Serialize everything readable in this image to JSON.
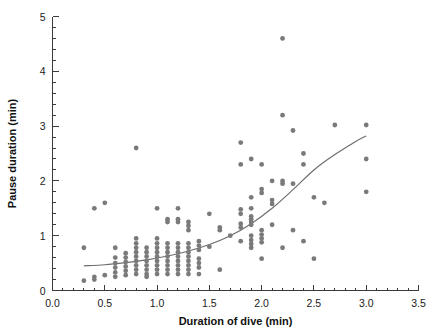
{
  "chart_data": {
    "type": "scatter",
    "title": "",
    "xlabel": "Duration of dive (min)",
    "ylabel": "Pause duration (min)",
    "xlim": [
      0.0,
      3.5
    ],
    "ylim": [
      0,
      5
    ],
    "xticks": [
      0.0,
      0.5,
      1.0,
      1.5,
      2.0,
      2.5,
      3.0,
      3.5
    ],
    "xticklabels": [
      "0.0",
      "0.5",
      "1.0",
      "1.5",
      "2.0",
      "2.5",
      "3.0",
      "3.5"
    ],
    "yticks": [
      0,
      1,
      2,
      3,
      4,
      5
    ],
    "yticklabels": [
      "0",
      "1",
      "2",
      "3",
      "4",
      "5"
    ],
    "x_minor_tick_step": 0.1,
    "y_minor_tick_step": 0.2,
    "grid": false,
    "legend": null,
    "marker": {
      "shape": "circle",
      "color": "#7a7a7a",
      "size_px": 4.6
    },
    "points": [
      [
        0.3,
        0.78
      ],
      [
        0.3,
        0.18
      ],
      [
        0.4,
        1.5
      ],
      [
        0.4,
        0.25
      ],
      [
        0.4,
        0.2
      ],
      [
        0.5,
        1.6
      ],
      [
        0.5,
        0.28
      ],
      [
        0.6,
        0.78
      ],
      [
        0.6,
        0.6
      ],
      [
        0.6,
        0.5
      ],
      [
        0.6,
        0.42
      ],
      [
        0.6,
        0.33
      ],
      [
        0.6,
        0.25
      ],
      [
        0.7,
        0.68
      ],
      [
        0.7,
        0.6
      ],
      [
        0.7,
        0.52
      ],
      [
        0.7,
        0.44
      ],
      [
        0.7,
        0.36
      ],
      [
        0.7,
        0.28
      ],
      [
        0.8,
        2.6
      ],
      [
        0.8,
        0.95
      ],
      [
        0.8,
        0.86
      ],
      [
        0.8,
        0.78
      ],
      [
        0.8,
        0.7
      ],
      [
        0.8,
        0.62
      ],
      [
        0.8,
        0.54
      ],
      [
        0.8,
        0.46
      ],
      [
        0.8,
        0.38
      ],
      [
        0.8,
        0.3
      ],
      [
        0.9,
        0.78
      ],
      [
        0.9,
        0.7
      ],
      [
        0.9,
        0.62
      ],
      [
        0.9,
        0.54
      ],
      [
        0.9,
        0.46
      ],
      [
        0.9,
        0.38
      ],
      [
        0.9,
        0.3
      ],
      [
        0.9,
        0.25
      ],
      [
        1.0,
        1.5
      ],
      [
        1.0,
        0.95
      ],
      [
        1.0,
        0.86
      ],
      [
        1.0,
        0.78
      ],
      [
        1.0,
        0.7
      ],
      [
        1.0,
        0.62
      ],
      [
        1.0,
        0.54
      ],
      [
        1.0,
        0.46
      ],
      [
        1.0,
        0.38
      ],
      [
        1.0,
        0.3
      ],
      [
        1.1,
        1.3
      ],
      [
        1.1,
        1.25
      ],
      [
        1.1,
        0.86
      ],
      [
        1.1,
        0.78
      ],
      [
        1.1,
        0.7
      ],
      [
        1.1,
        0.62
      ],
      [
        1.1,
        0.54
      ],
      [
        1.1,
        0.46
      ],
      [
        1.1,
        0.38
      ],
      [
        1.1,
        0.3
      ],
      [
        1.2,
        1.5
      ],
      [
        1.2,
        1.3
      ],
      [
        1.2,
        1.25
      ],
      [
        1.2,
        0.86
      ],
      [
        1.2,
        0.78
      ],
      [
        1.2,
        0.7
      ],
      [
        1.2,
        0.62
      ],
      [
        1.2,
        0.54
      ],
      [
        1.2,
        0.46
      ],
      [
        1.2,
        0.38
      ],
      [
        1.2,
        0.3
      ],
      [
        1.3,
        1.25
      ],
      [
        1.3,
        1.18
      ],
      [
        1.3,
        1.1
      ],
      [
        1.3,
        0.86
      ],
      [
        1.3,
        0.78
      ],
      [
        1.3,
        0.7
      ],
      [
        1.3,
        0.62
      ],
      [
        1.3,
        0.54
      ],
      [
        1.3,
        0.46
      ],
      [
        1.3,
        0.38
      ],
      [
        1.3,
        0.3
      ],
      [
        1.4,
        0.9
      ],
      [
        1.4,
        0.82
      ],
      [
        1.4,
        0.74
      ],
      [
        1.4,
        0.58
      ],
      [
        1.4,
        0.5
      ],
      [
        1.4,
        0.42
      ],
      [
        1.4,
        0.3
      ],
      [
        1.5,
        1.4
      ],
      [
        1.5,
        0.8
      ],
      [
        1.6,
        1.15
      ],
      [
        1.6,
        1.1
      ],
      [
        1.6,
        0.38
      ],
      [
        1.7,
        1.0
      ],
      [
        1.8,
        2.7
      ],
      [
        1.8,
        2.3
      ],
      [
        1.8,
        1.48
      ],
      [
        1.8,
        1.4
      ],
      [
        1.8,
        1.22
      ],
      [
        1.8,
        1.15
      ],
      [
        1.8,
        0.9
      ],
      [
        1.9,
        2.4
      ],
      [
        1.9,
        1.7
      ],
      [
        1.9,
        1.5
      ],
      [
        1.9,
        1.35
      ],
      [
        1.9,
        1.3
      ],
      [
        1.9,
        1.25
      ],
      [
        1.9,
        1.2
      ],
      [
        1.9,
        1.0
      ],
      [
        1.9,
        0.92
      ],
      [
        1.9,
        0.85
      ],
      [
        1.9,
        0.78
      ],
      [
        2.0,
        2.3
      ],
      [
        2.0,
        1.85
      ],
      [
        2.0,
        1.78
      ],
      [
        2.0,
        1.1
      ],
      [
        2.0,
        1.02
      ],
      [
        2.0,
        0.95
      ],
      [
        2.0,
        0.88
      ],
      [
        2.0,
        0.58
      ],
      [
        2.1,
        2.0
      ],
      [
        2.1,
        1.65
      ],
      [
        2.1,
        1.58
      ],
      [
        2.1,
        1.2
      ],
      [
        2.2,
        4.6
      ],
      [
        2.2,
        3.2
      ],
      [
        2.2,
        2.0
      ],
      [
        2.2,
        1.95
      ],
      [
        2.2,
        0.78
      ],
      [
        2.3,
        2.92
      ],
      [
        2.3,
        1.95
      ],
      [
        2.3,
        1.1
      ],
      [
        2.4,
        2.5
      ],
      [
        2.4,
        2.3
      ],
      [
        2.4,
        0.9
      ],
      [
        2.5,
        1.7
      ],
      [
        2.5,
        0.58
      ],
      [
        2.6,
        1.6
      ],
      [
        2.7,
        3.02
      ],
      [
        3.0,
        3.02
      ],
      [
        3.0,
        2.4
      ],
      [
        3.0,
        1.8
      ]
    ],
    "fit_curve": {
      "label": "fitted trend",
      "x": [
        0.3,
        0.5,
        0.7,
        0.9,
        1.1,
        1.3,
        1.5,
        1.7,
        1.9,
        2.1,
        2.3,
        2.5,
        2.7,
        2.9,
        3.0
      ],
      "y": [
        0.45,
        0.47,
        0.51,
        0.56,
        0.63,
        0.72,
        0.84,
        1.0,
        1.22,
        1.5,
        1.84,
        2.2,
        2.48,
        2.72,
        2.82
      ]
    }
  }
}
